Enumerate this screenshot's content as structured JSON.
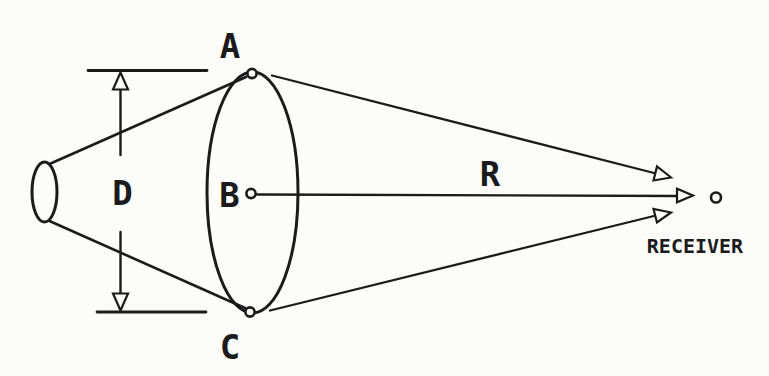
{
  "diagram": {
    "labels": {
      "point_a": "A",
      "point_b": "B",
      "point_c": "C",
      "diameter": "D",
      "range": "R",
      "receiver": "RECEIVER"
    },
    "colors": {
      "ink": "#1b1b1b",
      "paper": "#fcfcfb"
    }
  }
}
